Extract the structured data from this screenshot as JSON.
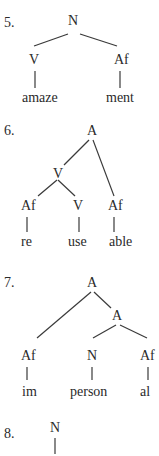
{
  "trees": [
    {
      "number": "5.",
      "root": "N",
      "nodes": {
        "left": "V",
        "right": "Af"
      },
      "morphemes": [
        "amaze",
        "ment"
      ]
    },
    {
      "number": "6.",
      "root": "A",
      "nodes": {
        "inner": "V",
        "af1": "Af",
        "v": "V",
        "af2": "Af"
      },
      "morphemes": [
        "re",
        "use",
        "able"
      ]
    },
    {
      "number": "7.",
      "root": "A",
      "nodes": {
        "inner": "A",
        "af1": "Af",
        "n": "N",
        "af2": "Af"
      },
      "morphemes": [
        "im",
        "person",
        "al"
      ]
    },
    {
      "number": "8.",
      "root": "N"
    }
  ]
}
